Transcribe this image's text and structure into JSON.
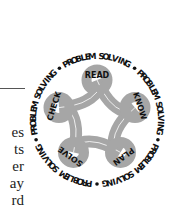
{
  "page": {
    "left_text_fragments": [
      "es",
      "ts",
      "er",
      "ay",
      "rd"
    ]
  },
  "logo": {
    "ring_text": "PROBLEM SOLVING",
    "ring_repeats": 5,
    "separator": "•",
    "steps": [
      "READ",
      "KNOW",
      "PLAN",
      "SOLVE",
      "CHECK"
    ],
    "colors": {
      "loop_fill": "#a6a6a6",
      "text": "#111111",
      "rule": "#555555"
    }
  }
}
